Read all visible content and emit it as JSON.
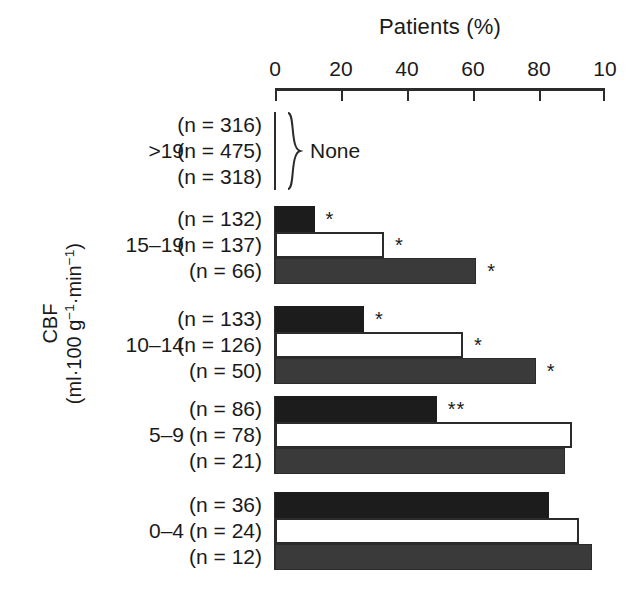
{
  "chart_data": {
    "type": "bar",
    "orientation": "horizontal",
    "title": "Patients (%)",
    "xlabel": "Patients (%)",
    "ylabel": "CBF (ml·100 g⁻¹·min⁻¹)",
    "ylabel_line1": "CBF",
    "ylabel_line2_prefix": "(ml·100 g",
    "ylabel_line2_sup1": "−1",
    "ylabel_line2_mid": "·min",
    "ylabel_line2_sup2": "−1",
    "ylabel_line2_suffix": ")",
    "xlim": [
      0,
      100
    ],
    "xticks": [
      0,
      20,
      40,
      60,
      80,
      100
    ],
    "xtick_labels": [
      "0",
      "20",
      "40",
      "60",
      "80",
      "10"
    ],
    "grid": false,
    "legend": "none",
    "categories": [
      ">19",
      "15–19",
      "10–14",
      "5–9",
      "0–4"
    ],
    "series": [
      {
        "name": "series-1-black",
        "style": "filled-black",
        "values": [
          null,
          12,
          27,
          49,
          83
        ]
      },
      {
        "name": "series-2-white",
        "style": "open-white",
        "values": [
          null,
          33,
          57,
          90,
          92
        ]
      },
      {
        "name": "series-3-gray",
        "style": "filled-gray",
        "values": [
          null,
          61,
          79,
          88,
          96
        ]
      }
    ],
    "n_values": [
      [
        316,
        475,
        318
      ],
      [
        132,
        137,
        66
      ],
      [
        133,
        126,
        50
      ],
      [
        86,
        78,
        21
      ],
      [
        36,
        24,
        12
      ]
    ],
    "significance": [
      [
        null,
        null,
        null
      ],
      [
        "*",
        "*",
        "*"
      ],
      [
        "*",
        "*",
        "*"
      ],
      [
        "**",
        null,
        null
      ],
      [
        null,
        null,
        null
      ]
    ],
    "annotations": [
      {
        "text": "None",
        "category": ">19",
        "note": "brace spanning all three bars of the >19 group; no bars drawn"
      }
    ],
    "colors": {
      "black_bar": "#1c1c1c",
      "gray_bar": "#3a3a3a",
      "white_bar_fill": "#ffffff",
      "outline": "#2b2b2b",
      "text": "#1a1a1a",
      "background": "#ffffff"
    }
  },
  "groups": [
    {
      "category": ">19",
      "rows": [
        {
          "n_label": "(n = 316)",
          "sig": ""
        },
        {
          "n_label": "(n = 475)",
          "sig": ""
        },
        {
          "n_label": "(n = 318)",
          "sig": ""
        }
      ],
      "none_label": "None"
    },
    {
      "category": "15–19",
      "rows": [
        {
          "n_label": "(n = 132)",
          "sig": "*"
        },
        {
          "n_label": "(n = 137)",
          "sig": "*"
        },
        {
          "n_label": "(n = 66)",
          "sig": "*"
        }
      ]
    },
    {
      "category": "10–14",
      "rows": [
        {
          "n_label": "(n = 133)",
          "sig": "*"
        },
        {
          "n_label": "(n = 126)",
          "sig": "*"
        },
        {
          "n_label": "(n = 50)",
          "sig": "*"
        }
      ]
    },
    {
      "category": "5–9",
      "rows": [
        {
          "n_label": "(n = 86)",
          "sig": "**"
        },
        {
          "n_label": "(n = 78)",
          "sig": ""
        },
        {
          "n_label": "(n = 21)",
          "sig": ""
        }
      ]
    },
    {
      "category": "0–4",
      "rows": [
        {
          "n_label": "(n = 36)",
          "sig": ""
        },
        {
          "n_label": "(n = 24)",
          "sig": ""
        },
        {
          "n_label": "(n = 12)",
          "sig": ""
        }
      ]
    }
  ]
}
